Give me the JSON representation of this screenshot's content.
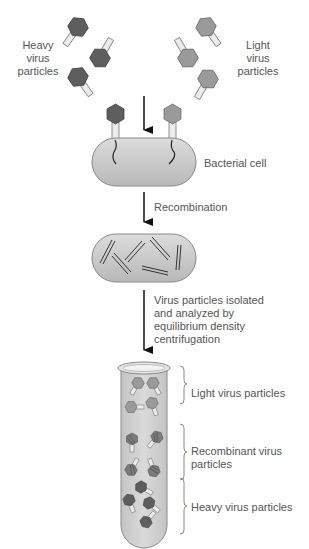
{
  "labels": {
    "heavy_top": [
      "Heavy",
      "virus",
      "particles"
    ],
    "light_top": [
      "Light",
      "virus",
      "particles"
    ],
    "bacterial_cell": "Bacterial cell",
    "recombination": "Recombination",
    "isolation": [
      "Virus particles isolated",
      "and analyzed by",
      "equilibrium density",
      "centrifugation"
    ],
    "tube_light": "Light virus particles",
    "tube_recombinant": [
      "Recombinant virus",
      "particles"
    ],
    "tube_heavy": "Heavy virus particles"
  },
  "colors": {
    "heavy": "#5e5e5e",
    "light": "#9a9a9a",
    "cell_fill": "#c8c8c8",
    "tube_fill": "#cfcfcf",
    "tail": "#e8e8e8"
  }
}
